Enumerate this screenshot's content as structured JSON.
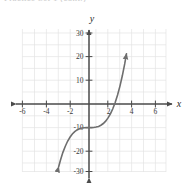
{
  "figure": {
    "cropped_header_text": "Practice Set 1  (cont.)",
    "background_color": "#ffffff"
  },
  "chart_data": {
    "type": "line",
    "title": "",
    "subtitle": "",
    "xlabel": "x",
    "ylabel": "y",
    "xlim": [
      -6.8,
      6.8
    ],
    "ylim": [
      -33,
      33
    ],
    "grid": true,
    "grid_color": "#e3e3e3",
    "grid_x_step": 1,
    "grid_y_step": 5,
    "axis_color": "#555555",
    "curve_color": "#6e6e6e",
    "legend": "none",
    "x_ticks": [
      -6,
      -4,
      -2,
      2,
      4,
      6
    ],
    "x_tick_labels": [
      "-6",
      "-4",
      "-2",
      "2",
      "4",
      "6"
    ],
    "y_ticks": [
      30,
      20,
      10,
      -10,
      -20,
      -30
    ],
    "y_tick_labels": [
      "30",
      "20",
      "10",
      "-10",
      "-20",
      "-30"
    ],
    "series": [
      {
        "name": "cubic",
        "equation": "y = x^3 - 10",
        "arrow_start": true,
        "arrow_end": true,
        "x": [
          -2.55,
          -2.4,
          -2.2,
          -2.0,
          -1.8,
          -1.6,
          -1.4,
          -1.2,
          -1.0,
          -0.8,
          -0.6,
          -0.4,
          -0.2,
          0.0,
          0.2,
          0.4,
          0.6,
          0.8,
          1.0,
          1.2,
          1.4,
          1.6,
          1.8,
          2.0,
          2.2,
          2.4,
          2.6,
          2.8,
          3.0,
          3.15
        ],
        "y": [
          -26.6,
          -23.8,
          -20.6,
          -18.0,
          -15.8,
          -14.1,
          -12.7,
          -11.7,
          -11.0,
          -10.5,
          -10.2,
          -10.06,
          -10.008,
          -10.0,
          -9.99,
          -9.94,
          -9.78,
          -9.49,
          -9.0,
          -8.27,
          -7.25,
          -5.9,
          -4.17,
          -2.0,
          0.65,
          3.82,
          7.58,
          11.95,
          17.0,
          21.3
        ]
      }
    ],
    "annotations": {
      "y_intercept": -10,
      "inflection_point": [
        0,
        -10
      ],
      "x_intercept_approx": 2.15
    }
  },
  "labels": {
    "x_axis_name": "x",
    "y_axis_name": "y"
  }
}
